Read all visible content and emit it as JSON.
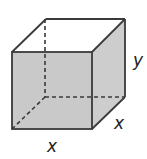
{
  "diagram": {
    "type": "rectangular-prism",
    "labels": {
      "height": "y",
      "width": "x",
      "depth": "x"
    },
    "colors": {
      "face_fill": "#c9c9c9",
      "side_fill": "#cdcdcd",
      "top_fill": "#ffffff",
      "edge": "#3a3a3a",
      "label": "#222222"
    },
    "vertices": {
      "front_top_left": [
        12,
        52
      ],
      "front_top_right": [
        92,
        52
      ],
      "front_bottom_left": [
        12,
        129
      ],
      "front_bottom_right": [
        92,
        129
      ],
      "back_top_left": [
        46,
        19
      ],
      "back_top_right": [
        125,
        19
      ],
      "back_bottom_left": [
        45,
        97
      ],
      "back_bottom_right": [
        125,
        97
      ]
    }
  }
}
